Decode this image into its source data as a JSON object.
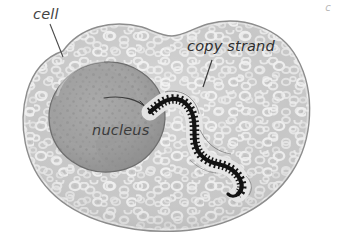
{
  "figure": {
    "type": "biology-diagram",
    "background_color": "#ffffff",
    "width": 337,
    "height": 239
  },
  "labels": {
    "cell": "cell",
    "copy_strand": "copy strand",
    "nucleus": "nucleus",
    "corner_mark": "c"
  },
  "colors": {
    "cytoplasm_fill": "#c9c9c9",
    "cytoplasm_light": "#e6e6e6",
    "cell_outline": "#8a8a8a",
    "nucleus_fill": "#a6a6a6",
    "nucleus_dark": "#8f8f8f",
    "nucleus_outline": "#6f6f6f",
    "strand_dark": "#141414",
    "strand_halo": "#f2f2f2",
    "label_text": "#3a3a3a",
    "leader_line": "#4a4a4a"
  },
  "structures": {
    "cell": {
      "name": "cell",
      "shape": "kidney-bean outline with mottled cytoplasm texture"
    },
    "nucleus": {
      "name": "nucleus",
      "shape": "dark speckled ellipse at left of cell"
    },
    "copy_strand": {
      "name": "copy strand",
      "shape": "serpentine zipper-toothed ribbon emerging from nucleus toward lower right"
    }
  },
  "leaders": {
    "cell_leader": "line from cell label down-right to cell membrane",
    "copy_strand_leader": "short diagonal line from copy strand label down-left to strand",
    "nucleus_internal_line": "thin curved line inside nucleus meeting strand origin"
  }
}
